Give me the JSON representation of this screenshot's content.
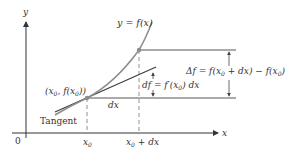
{
  "diagram": {
    "axes": {
      "x_label": "x",
      "y_label": "y",
      "origin_label": "0"
    },
    "curve_label": "y = f(x)",
    "point_label": "(x0, f(x0))",
    "point_label_parts": {
      "open": "(x",
      "sub": "0",
      "mid": ", f(x",
      "sub2": "0",
      "close": "))"
    },
    "tangent_label": "Tangent",
    "dx_label": "dx",
    "df_label": "df = f′(x0) dx",
    "df_parts": {
      "a": "df = f′(x",
      "sub": "0",
      "b": ") dx"
    },
    "delta_f_label": "Δf = f(x0 + dx) − f(x0)",
    "delta_f_parts": {
      "a": "Δf = f(x",
      "sub": "0",
      "b": " + dx) − f(x",
      "sub2": "0",
      "c": ")"
    },
    "x_ticks": [
      {
        "label": "x0",
        "base": "x",
        "sub": "0"
      },
      {
        "label": "x0 + dx",
        "base": "x",
        "sub": "0",
        "rest": " + dx"
      }
    ],
    "colors": {
      "curve": "#8c8c8c",
      "tangent": "#3a3a3a",
      "axes": "#333333",
      "guides": "#555555",
      "point": "#8c8c8c"
    }
  }
}
